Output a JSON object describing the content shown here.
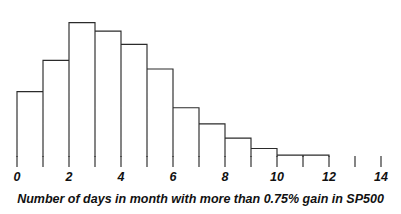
{
  "chart_data": {
    "type": "bar",
    "title": "",
    "subtitle": "",
    "xlabel": "Number of days in month with more than 0.75% gain in SP500",
    "ylabel": "",
    "categories": [
      "0",
      "1",
      "2",
      "3",
      "4",
      "5",
      "6",
      "7",
      "8",
      "9",
      "10",
      "11"
    ],
    "bin_edges": [
      0,
      1,
      2,
      3,
      4,
      5,
      6,
      7,
      8,
      9,
      10,
      11,
      12
    ],
    "values": [
      69,
      102,
      142,
      133,
      119,
      93,
      52,
      35,
      20,
      9,
      2,
      2
    ],
    "x_tick_labels": [
      "0",
      "2",
      "4",
      "6",
      "8",
      "10",
      "12",
      "14"
    ],
    "x_tick_values": [
      0,
      2,
      4,
      6,
      8,
      10,
      12,
      14
    ],
    "xlim": [
      -0.65,
      14.6
    ],
    "ylim": [
      0,
      150
    ],
    "grid": false,
    "legend": null,
    "legend_position": "none",
    "axis_style": "x-axis ticks only, no y-axis, open histogram outline",
    "bar_style": "unfilled rectangles with dark outline, shared edges",
    "annotations": []
  },
  "style": {
    "background_color": "#ffffff",
    "line_color": "#2b2b2b",
    "text_color": "#111111"
  }
}
